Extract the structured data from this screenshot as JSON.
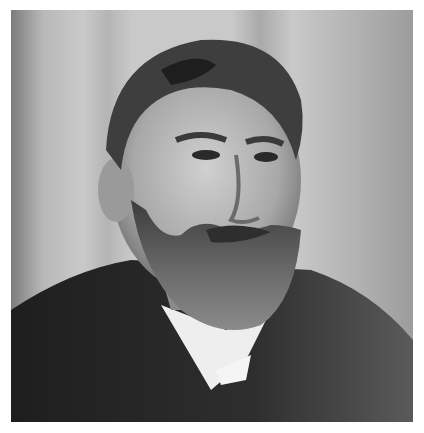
{
  "image": {
    "subject": "black-and-white portrait photograph of a bearded man in a dark suit with white collar",
    "palette": {
      "background": "#ffffff",
      "backdrop": "#c9c9c9",
      "hair": "#3a3a3a",
      "skin": "#b8b8b8",
      "beard": "#5a5a5a",
      "suit": "#2a2a2a",
      "collar": "#f2f2f2"
    }
  }
}
